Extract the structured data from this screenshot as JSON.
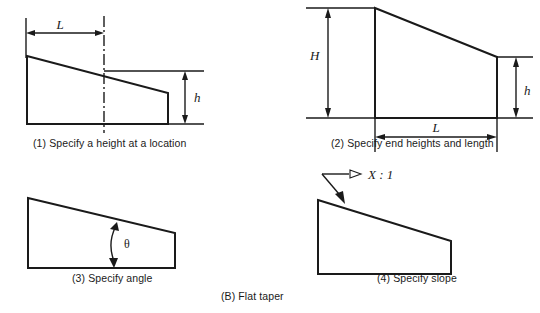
{
  "figure": {
    "main_caption": "(B) Flat taper",
    "panels": [
      {
        "id": "specify-height-at-location",
        "caption": "(1) Specify a height at a location",
        "dimensions": [
          {
            "symbol": "L",
            "kind": "horizontal-length-to-centerline"
          },
          {
            "symbol": "h",
            "kind": "vertical-height-at-location"
          }
        ],
        "annotations": [
          "centerline"
        ]
      },
      {
        "id": "specify-end-heights-and-length",
        "caption": "(2) Specify end heights and length",
        "dimensions": [
          {
            "symbol": "H",
            "kind": "vertical-height-left-end"
          },
          {
            "symbol": "h",
            "kind": "vertical-height-right-end"
          },
          {
            "symbol": "L",
            "kind": "horizontal-overall-length"
          }
        ],
        "annotations": []
      },
      {
        "id": "specify-angle",
        "caption": "(3) Specify angle",
        "dimensions": [
          {
            "symbol": "θ",
            "kind": "taper-angle"
          }
        ],
        "annotations": []
      },
      {
        "id": "specify-slope",
        "caption": "(4) Specify slope",
        "dimensions": [
          {
            "symbol": "X : 1",
            "kind": "slope-ratio-leader"
          }
        ],
        "annotations": [
          "leader-arrow"
        ]
      }
    ]
  },
  "style": {
    "line_color": "#1a1a1a",
    "background_color": "#ffffff"
  }
}
